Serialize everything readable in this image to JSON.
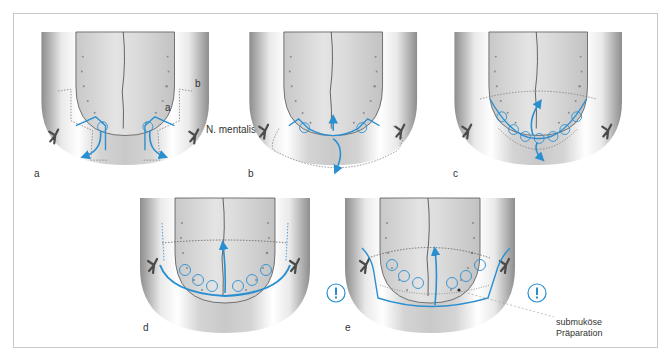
{
  "figure": {
    "panels": [
      {
        "id": "a",
        "label": "a",
        "inner_labels": [
          "a",
          "b"
        ],
        "nerve_label": "N. mentalis",
        "circles": 2,
        "arrows": 2
      },
      {
        "id": "b",
        "label": "b",
        "circles": 2,
        "arrows": 2
      },
      {
        "id": "c",
        "label": "c",
        "circles": 7,
        "arrows": 2
      },
      {
        "id": "d",
        "label": "d",
        "circles": 7,
        "arrows": 1
      },
      {
        "id": "e",
        "label": "e",
        "circles": 7,
        "arrows": 1,
        "warning_icons": 2,
        "annotation": {
          "line1": "submuköse",
          "line2": "Präparation"
        }
      }
    ],
    "warning_glyph": "!"
  },
  "colors": {
    "accent_blue": "#2a8fd0",
    "dotted_gray": "#7a7a7a",
    "frame": "#c8c8c8",
    "nerve": "#4a4a4a"
  }
}
